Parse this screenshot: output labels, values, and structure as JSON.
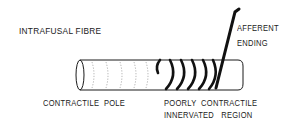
{
  "diagram": {
    "title_label": "INTRAFUSAL FIBRE",
    "afferent_label_line1": "AFFERENT",
    "afferent_label_line2": "ENDING",
    "pole_label": "CONTRACTILE  POLE",
    "region_label_line1": "POORLY  CONTRACTILE",
    "region_label_line2": "INNERVATED   REGION",
    "colors": {
      "ink": "#1a1a1a",
      "striation": "#9a9a9a",
      "background": "#ffffff"
    },
    "parts": [
      "intrafusal-fibre-cylinder",
      "contractile-pole-striations",
      "annulospiral-coil",
      "afferent-nerve-fibre"
    ]
  }
}
